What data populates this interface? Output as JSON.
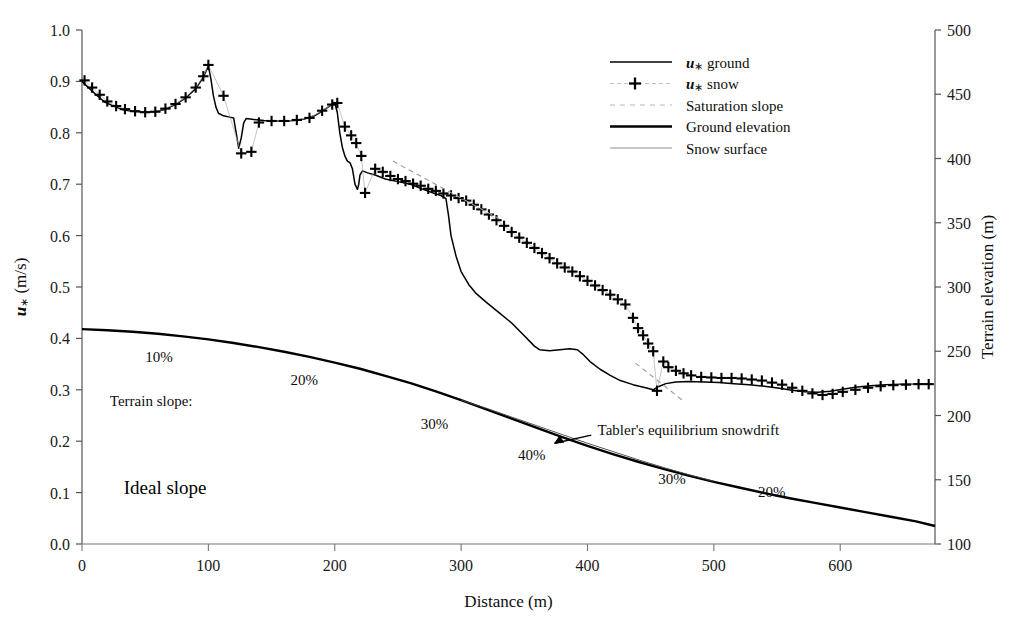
{
  "chart_data": {
    "type": "line",
    "title": "",
    "xlabel": "Distance (m)",
    "ylabel": "u* (m/s)",
    "y2label": "Terrain elevation (m)",
    "xlim": [
      0,
      675
    ],
    "ylim": [
      0.0,
      1.0
    ],
    "y2lim": [
      100,
      500
    ],
    "xticks": [
      0,
      100,
      200,
      300,
      400,
      500,
      600
    ],
    "yticks": [
      "0.0",
      "0.1",
      "0.2",
      "0.3",
      "0.4",
      "0.5",
      "0.6",
      "0.7",
      "0.8",
      "0.9",
      "1.0"
    ],
    "y2ticks": [
      100,
      150,
      200,
      250,
      300,
      350,
      400,
      450,
      500
    ],
    "grid": false,
    "legend_position": "top-right",
    "series": [
      {
        "name": "u* ground",
        "axis": "left",
        "style": "solid-line",
        "points": [
          [
            0,
            0.9
          ],
          [
            6,
            0.886
          ],
          [
            12,
            0.872
          ],
          [
            18,
            0.86
          ],
          [
            25,
            0.852
          ],
          [
            32,
            0.845
          ],
          [
            40,
            0.842
          ],
          [
            50,
            0.84
          ],
          [
            58,
            0.841
          ],
          [
            66,
            0.846
          ],
          [
            74,
            0.855
          ],
          [
            82,
            0.868
          ],
          [
            90,
            0.886
          ],
          [
            96,
            0.908
          ],
          [
            100,
            0.93
          ],
          [
            102,
            0.905
          ],
          [
            104,
            0.872
          ],
          [
            106,
            0.85
          ],
          [
            108,
            0.838
          ],
          [
            112,
            0.833
          ],
          [
            116,
            0.831
          ],
          [
            120,
            0.829
          ],
          [
            122,
            0.8
          ],
          [
            124,
            0.77
          ],
          [
            126,
            0.79
          ],
          [
            128,
            0.82
          ],
          [
            130,
            0.828
          ],
          [
            136,
            0.826
          ],
          [
            144,
            0.824
          ],
          [
            152,
            0.823
          ],
          [
            160,
            0.823
          ],
          [
            168,
            0.824
          ],
          [
            176,
            0.827
          ],
          [
            184,
            0.833
          ],
          [
            190,
            0.842
          ],
          [
            196,
            0.852
          ],
          [
            200,
            0.858
          ],
          [
            202,
            0.84
          ],
          [
            204,
            0.8
          ],
          [
            206,
            0.772
          ],
          [
            208,
            0.755
          ],
          [
            210,
            0.745
          ],
          [
            212,
            0.742
          ],
          [
            214,
            0.73
          ],
          [
            216,
            0.7
          ],
          [
            218,
            0.69
          ],
          [
            219,
            0.7
          ],
          [
            220,
            0.718
          ],
          [
            222,
            0.726
          ],
          [
            226,
            0.722
          ],
          [
            232,
            0.718
          ],
          [
            240,
            0.71
          ],
          [
            250,
            0.705
          ],
          [
            260,
            0.7
          ],
          [
            270,
            0.69
          ],
          [
            278,
            0.683
          ],
          [
            284,
            0.678
          ],
          [
            288,
            0.672
          ],
          [
            290,
            0.64
          ],
          [
            292,
            0.6
          ],
          [
            296,
            0.56
          ],
          [
            300,
            0.53
          ],
          [
            306,
            0.505
          ],
          [
            312,
            0.487
          ],
          [
            320,
            0.47
          ],
          [
            330,
            0.45
          ],
          [
            340,
            0.43
          ],
          [
            350,
            0.405
          ],
          [
            358,
            0.385
          ],
          [
            362,
            0.378
          ],
          [
            370,
            0.376
          ],
          [
            378,
            0.378
          ],
          [
            386,
            0.38
          ],
          [
            392,
            0.378
          ],
          [
            396,
            0.37
          ],
          [
            402,
            0.355
          ],
          [
            410,
            0.34
          ],
          [
            418,
            0.328
          ],
          [
            426,
            0.318
          ],
          [
            436,
            0.31
          ],
          [
            446,
            0.304
          ],
          [
            452,
            0.3
          ],
          [
            456,
            0.306
          ],
          [
            462,
            0.312
          ],
          [
            470,
            0.315
          ],
          [
            480,
            0.316
          ],
          [
            492,
            0.315
          ],
          [
            504,
            0.314
          ],
          [
            516,
            0.312
          ],
          [
            528,
            0.31
          ],
          [
            540,
            0.307
          ],
          [
            552,
            0.303
          ],
          [
            562,
            0.299
          ],
          [
            572,
            0.296
          ],
          [
            582,
            0.295
          ],
          [
            592,
            0.297
          ],
          [
            602,
            0.301
          ],
          [
            612,
            0.305
          ],
          [
            624,
            0.308
          ],
          [
            636,
            0.31
          ],
          [
            648,
            0.311
          ],
          [
            660,
            0.311
          ],
          [
            672,
            0.311
          ]
        ]
      },
      {
        "name": "u* snow",
        "axis": "left",
        "style": "plus-markers",
        "points": [
          [
            2,
            0.902
          ],
          [
            8,
            0.888
          ],
          [
            14,
            0.874
          ],
          [
            20,
            0.861
          ],
          [
            27,
            0.852
          ],
          [
            34,
            0.846
          ],
          [
            42,
            0.842
          ],
          [
            50,
            0.84
          ],
          [
            58,
            0.841
          ],
          [
            66,
            0.847
          ],
          [
            74,
            0.856
          ],
          [
            82,
            0.869
          ],
          [
            90,
            0.888
          ],
          [
            96,
            0.91
          ],
          [
            100,
            0.932
          ],
          [
            112,
            0.872
          ],
          [
            126,
            0.76
          ],
          [
            134,
            0.763
          ],
          [
            140,
            0.82
          ],
          [
            150,
            0.823
          ],
          [
            160,
            0.823
          ],
          [
            170,
            0.825
          ],
          [
            180,
            0.829
          ],
          [
            190,
            0.843
          ],
          [
            198,
            0.855
          ],
          [
            202,
            0.858
          ],
          [
            208,
            0.812
          ],
          [
            213,
            0.795
          ],
          [
            217,
            0.78
          ],
          [
            221,
            0.755
          ],
          [
            224,
            0.683
          ],
          [
            232,
            0.73
          ],
          [
            238,
            0.724
          ],
          [
            244,
            0.716
          ],
          [
            250,
            0.71
          ],
          [
            256,
            0.706
          ],
          [
            262,
            0.701
          ],
          [
            268,
            0.697
          ],
          [
            274,
            0.691
          ],
          [
            280,
            0.687
          ],
          [
            286,
            0.682
          ],
          [
            292,
            0.678
          ],
          [
            298,
            0.673
          ],
          [
            304,
            0.668
          ],
          [
            310,
            0.66
          ],
          [
            316,
            0.651
          ],
          [
            322,
            0.641
          ],
          [
            328,
            0.63
          ],
          [
            334,
            0.619
          ],
          [
            340,
            0.607
          ],
          [
            346,
            0.596
          ],
          [
            352,
            0.586
          ],
          [
            358,
            0.576
          ],
          [
            364,
            0.566
          ],
          [
            370,
            0.556
          ],
          [
            376,
            0.546
          ],
          [
            382,
            0.538
          ],
          [
            388,
            0.53
          ],
          [
            394,
            0.521
          ],
          [
            400,
            0.512
          ],
          [
            406,
            0.503
          ],
          [
            412,
            0.494
          ],
          [
            418,
            0.485
          ],
          [
            424,
            0.476
          ],
          [
            430,
            0.466
          ],
          [
            436,
            0.44
          ],
          [
            440,
            0.42
          ],
          [
            444,
            0.406
          ],
          [
            448,
            0.39
          ],
          [
            452,
            0.375
          ],
          [
            455,
            0.298
          ],
          [
            460,
            0.355
          ],
          [
            464,
            0.344
          ],
          [
            470,
            0.337
          ],
          [
            476,
            0.332
          ],
          [
            482,
            0.328
          ],
          [
            490,
            0.325
          ],
          [
            498,
            0.324
          ],
          [
            506,
            0.323
          ],
          [
            514,
            0.323
          ],
          [
            522,
            0.322
          ],
          [
            530,
            0.32
          ],
          [
            538,
            0.318
          ],
          [
            546,
            0.314
          ],
          [
            554,
            0.31
          ],
          [
            562,
            0.304
          ],
          [
            570,
            0.298
          ],
          [
            578,
            0.293
          ],
          [
            586,
            0.29
          ],
          [
            594,
            0.292
          ],
          [
            602,
            0.296
          ],
          [
            612,
            0.3
          ],
          [
            622,
            0.304
          ],
          [
            632,
            0.307
          ],
          [
            642,
            0.309
          ],
          [
            652,
            0.31
          ],
          [
            662,
            0.311
          ],
          [
            670,
            0.311
          ]
        ]
      },
      {
        "name": "Saturation slope",
        "axis": "left",
        "style": "dashed-line",
        "segments": [
          [
            [
              246,
              0.745
            ],
            [
              330,
              0.633
            ]
          ],
          [
            [
              438,
              0.352
            ],
            [
              476,
              0.278
            ]
          ]
        ]
      },
      {
        "name": "Ground elevation",
        "axis": "left",
        "style": "thick-solid-line",
        "points": [
          [
            0,
            0.418
          ],
          [
            20,
            0.416
          ],
          [
            40,
            0.413
          ],
          [
            60,
            0.409
          ],
          [
            80,
            0.404
          ],
          [
            100,
            0.398
          ],
          [
            120,
            0.391
          ],
          [
            140,
            0.383
          ],
          [
            160,
            0.374
          ],
          [
            180,
            0.364
          ],
          [
            200,
            0.353
          ],
          [
            220,
            0.341
          ],
          [
            240,
            0.327
          ],
          [
            260,
            0.313
          ],
          [
            280,
            0.297
          ],
          [
            300,
            0.28
          ],
          [
            320,
            0.262
          ],
          [
            340,
            0.244
          ],
          [
            360,
            0.226
          ],
          [
            380,
            0.208
          ],
          [
            400,
            0.191
          ],
          [
            420,
            0.175
          ],
          [
            440,
            0.16
          ],
          [
            460,
            0.146
          ],
          [
            480,
            0.133
          ],
          [
            500,
            0.121
          ],
          [
            520,
            0.11
          ],
          [
            540,
            0.099
          ],
          [
            560,
            0.089
          ],
          [
            580,
            0.08
          ],
          [
            600,
            0.071
          ],
          [
            620,
            0.062
          ],
          [
            640,
            0.053
          ],
          [
            660,
            0.044
          ],
          [
            675,
            0.035
          ]
        ],
        "elevations_m": [
          267,
          266,
          265,
          264,
          262,
          259,
          256,
          253,
          250,
          246,
          241,
          236,
          231,
          225,
          219,
          212,
          205,
          198,
          190,
          183,
          176,
          170,
          164,
          158,
          153,
          148,
          144,
          140,
          136,
          132,
          128,
          125,
          121,
          118,
          114
        ]
      },
      {
        "name": "Snow surface",
        "axis": "left",
        "style": "thin-solid-line",
        "points": [
          [
            300,
            0.28
          ],
          [
            320,
            0.264
          ],
          [
            340,
            0.247
          ],
          [
            360,
            0.23
          ],
          [
            380,
            0.213
          ],
          [
            400,
            0.196
          ],
          [
            420,
            0.18
          ],
          [
            440,
            0.164
          ],
          [
            460,
            0.149
          ],
          [
            480,
            0.135
          ],
          [
            500,
            0.122
          ]
        ]
      }
    ],
    "annotations": [
      {
        "text": "10%",
        "x": 50,
        "y": 0.355,
        "size": "small"
      },
      {
        "text": "20%",
        "x": 165,
        "y": 0.31,
        "size": "small"
      },
      {
        "text": "Terrain slope:",
        "x": 22,
        "y": 0.268,
        "size": "small"
      },
      {
        "text": "30%",
        "x": 268,
        "y": 0.224,
        "size": "small"
      },
      {
        "text": "40%",
        "x": 345,
        "y": 0.164,
        "size": "small"
      },
      {
        "text": "30%",
        "x": 456,
        "y": 0.117,
        "size": "small"
      },
      {
        "text": "20%",
        "x": 535,
        "y": 0.091,
        "size": "small"
      },
      {
        "text": "Ideal slope",
        "x": 33,
        "y": 0.098,
        "size": "big"
      },
      {
        "text": "Tabler's equilibrium snowdrift",
        "x": 408,
        "y": 0.212,
        "size": "small"
      }
    ],
    "legend_entries": [
      {
        "label_prefix": "u",
        "label_star": "∗",
        "label_suffix": " ground",
        "style": "solid-line"
      },
      {
        "label_prefix": "u",
        "label_star": "∗",
        "label_suffix": " snow",
        "style": "plus-marker"
      },
      {
        "label_prefix": "",
        "label_star": "",
        "label_suffix": "Saturation slope",
        "style": "dashed-line"
      },
      {
        "label_prefix": "",
        "label_star": "",
        "label_suffix": "Ground elevation",
        "style": "thick-line"
      },
      {
        "label_prefix": "",
        "label_star": "",
        "label_suffix": "Snow surface",
        "style": "thin-line"
      }
    ]
  }
}
